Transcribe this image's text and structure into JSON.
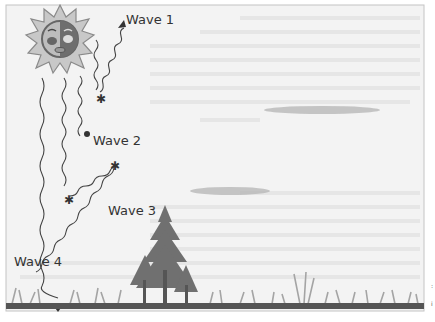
{
  "diagram": {
    "labels": {
      "wave1": "Wave 1",
      "wave2": "Wave 2",
      "wave3": "Wave 3",
      "wave4": "Wave 4"
    },
    "colors": {
      "background": "#f3f3f3",
      "frame": "#bdbdbd",
      "wave_line": "#444444",
      "sun_fill": "#9a9a9a",
      "ground": "#555555",
      "grass": "#a8a8a8",
      "tree": "#6e6e6e",
      "cloud": "#b5b5b5"
    },
    "side_marks": [
      ":",
      "i"
    ]
  }
}
